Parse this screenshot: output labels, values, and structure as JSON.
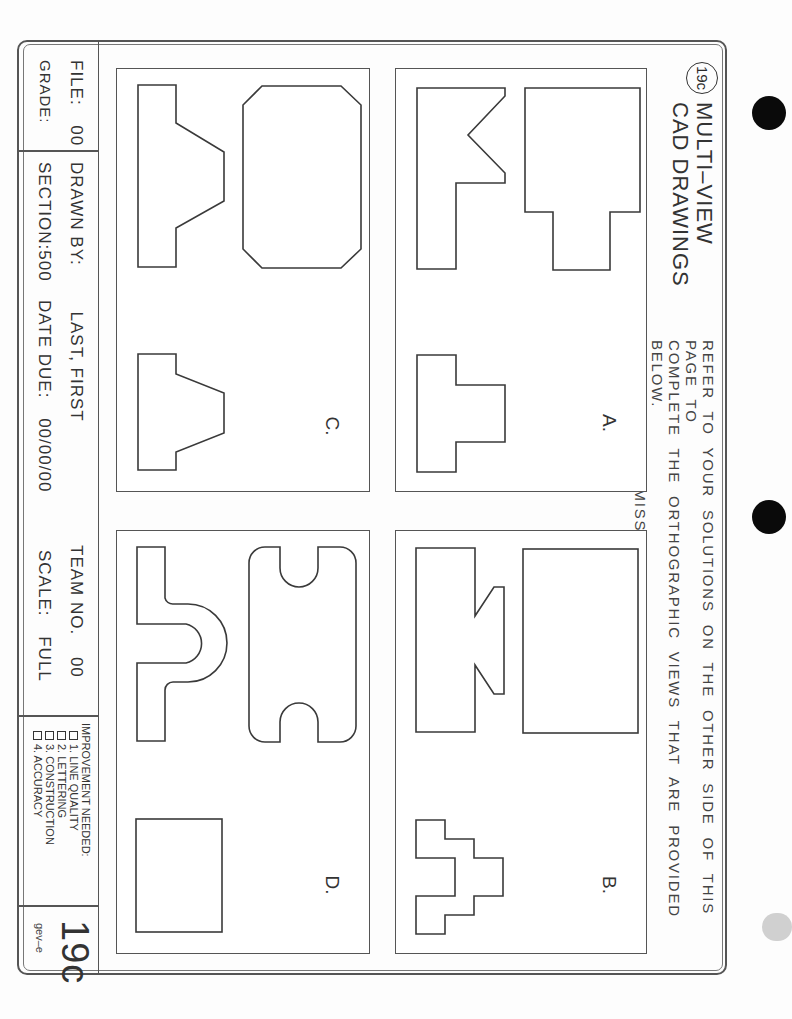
{
  "header": {
    "badge": "19c",
    "title_line1": "MULTI–VIEW",
    "title_line2": "CAD DRAWINGS",
    "instructions": [
      "REFER TO YOUR SOLUTIONS ON THE OTHER SIDE OF THIS PAGE TO",
      "COMPLETE THE ORTHOGRAPHIC VIEWS THAT ARE PROVIDED BELOW.",
      "LINES MAY BE MISSING FROM ANY OR ALL VIEWS."
    ]
  },
  "panels": [
    {
      "id": "A",
      "label": "A."
    },
    {
      "id": "B",
      "label": "B."
    },
    {
      "id": "C",
      "label": "C."
    },
    {
      "id": "D",
      "label": "D."
    }
  ],
  "title_block": {
    "file_label": "FILE:",
    "file_value": "00",
    "grade_label": "GRADE:",
    "drawn_by_label": "DRAWN BY:",
    "drawn_by_value": "LAST, FIRST",
    "team_label": "TEAM NO.",
    "team_value": "00",
    "section_label": "SECTION:",
    "section_value": "500",
    "date_due_label": "DATE DUE:",
    "date_due_value": "00/00/00",
    "scale_label": "SCALE:",
    "scale_value": "FULL",
    "improvement": {
      "heading": "IMPROVEMENT NEEDED:",
      "items": [
        "1. LINE QUALITY",
        "2. LETTERING",
        "3. CONSTRUCTION",
        "4. ACCURACY"
      ]
    },
    "sheet_number": "19c",
    "sheet_code": "gev–e"
  },
  "colors": {
    "line": "#555555",
    "text": "#333333",
    "punch_hole": "#0a0a0a"
  }
}
